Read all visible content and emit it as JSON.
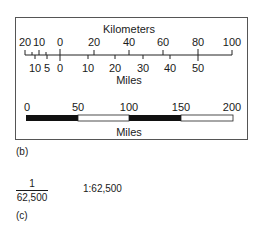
{
  "panel_b": {
    "caption": "(b)",
    "dual_scale": {
      "top_title": "Kilometers",
      "bottom_title": "Miles",
      "km_labels": [
        {
          "text": "20",
          "x": 25
        },
        {
          "text": "10",
          "x": 39
        },
        {
          "text": "0",
          "x": 60
        },
        {
          "text": "20",
          "x": 94
        },
        {
          "text": "40",
          "x": 129
        },
        {
          "text": "60",
          "x": 163
        },
        {
          "text": "80",
          "x": 198
        },
        {
          "text": "100",
          "x": 232
        }
      ],
      "mile_labels": [
        {
          "text": "10",
          "x": 35
        },
        {
          "text": "5",
          "x": 47
        },
        {
          "text": "0",
          "x": 60
        },
        {
          "text": "10",
          "x": 88
        },
        {
          "text": "20",
          "x": 115
        },
        {
          "text": "30",
          "x": 143
        },
        {
          "text": "40",
          "x": 170
        },
        {
          "text": "50",
          "x": 198
        }
      ]
    },
    "bar_scale": {
      "title": "Miles",
      "labels": [
        {
          "text": "0",
          "x": 27
        },
        {
          "text": "50",
          "x": 78
        },
        {
          "text": "100",
          "x": 129
        },
        {
          "text": "150",
          "x": 181
        },
        {
          "text": "200",
          "x": 232
        }
      ],
      "segments": [
        {
          "from": 0,
          "to": 50,
          "fill": "#111111"
        },
        {
          "from": 50,
          "to": 100,
          "fill": "#ffffff"
        },
        {
          "from": 100,
          "to": 150,
          "fill": "#111111"
        },
        {
          "from": 150,
          "to": 200,
          "fill": "#ffffff"
        }
      ]
    }
  },
  "panel_c": {
    "caption": "(c)",
    "fraction_numerator": "1",
    "fraction_denominator": "62,500",
    "ratio_text": "1:62,500"
  }
}
